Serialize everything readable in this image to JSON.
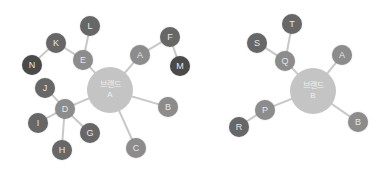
{
  "colors": {
    "edge": "#c8c8c8",
    "hub": "#c4c4c4",
    "level1": "#8c8c8c",
    "level2": "#676767",
    "level3": "#4a4a4a",
    "label": "#e6e6e6"
  },
  "diagrams": [
    {
      "id": "brand-a",
      "hub": {
        "title": "브랜드",
        "label": "A",
        "x": 110,
        "y": 90,
        "r": 23
      },
      "nodes": [
        {
          "id": "A",
          "label": "A",
          "x": 140,
          "y": 55,
          "level": 1
        },
        {
          "id": "B",
          "label": "B",
          "x": 168,
          "y": 107,
          "level": 1
        },
        {
          "id": "C",
          "label": "C",
          "x": 136,
          "y": 148,
          "level": 1
        },
        {
          "id": "D",
          "label": "D",
          "x": 65,
          "y": 109,
          "level": 1
        },
        {
          "id": "E",
          "label": "E",
          "x": 83,
          "y": 60,
          "level": 1
        },
        {
          "id": "F",
          "label": "F",
          "x": 170,
          "y": 37,
          "level": 2
        },
        {
          "id": "G",
          "label": "G",
          "x": 90,
          "y": 133,
          "level": 2
        },
        {
          "id": "H",
          "label": "H",
          "x": 62,
          "y": 150,
          "level": 2
        },
        {
          "id": "I",
          "label": "I",
          "x": 38,
          "y": 123,
          "level": 2
        },
        {
          "id": "J",
          "label": "J",
          "x": 45,
          "y": 88,
          "level": 2
        },
        {
          "id": "K",
          "label": "K",
          "x": 56,
          "y": 43,
          "level": 2
        },
        {
          "id": "L",
          "label": "L",
          "x": 90,
          "y": 26,
          "level": 2
        },
        {
          "id": "M",
          "label": "M",
          "x": 180,
          "y": 66,
          "level": 3
        },
        {
          "id": "N",
          "label": "N",
          "x": 32,
          "y": 65,
          "level": 3
        }
      ],
      "edges": [
        [
          "hub",
          "A"
        ],
        [
          "hub",
          "B"
        ],
        [
          "hub",
          "C"
        ],
        [
          "hub",
          "D"
        ],
        [
          "hub",
          "E"
        ],
        [
          "A",
          "F"
        ],
        [
          "F",
          "M"
        ],
        [
          "E",
          "L"
        ],
        [
          "E",
          "K"
        ],
        [
          "K",
          "N"
        ],
        [
          "D",
          "J"
        ],
        [
          "D",
          "I"
        ],
        [
          "D",
          "H"
        ],
        [
          "D",
          "G"
        ]
      ]
    },
    {
      "id": "brand-b",
      "hub": {
        "title": "브랜드",
        "label": "B",
        "x": 313,
        "y": 91,
        "r": 23
      },
      "nodes": [
        {
          "id": "A",
          "label": "A",
          "x": 342,
          "y": 55,
          "level": 1
        },
        {
          "id": "B",
          "label": "B",
          "x": 358,
          "y": 122,
          "level": 1
        },
        {
          "id": "Q",
          "label": "Q",
          "x": 285,
          "y": 61,
          "level": 1
        },
        {
          "id": "P",
          "label": "P",
          "x": 265,
          "y": 110,
          "level": 1
        },
        {
          "id": "S",
          "label": "S",
          "x": 257,
          "y": 43,
          "level": 2
        },
        {
          "id": "T",
          "label": "T",
          "x": 292,
          "y": 24,
          "level": 2
        },
        {
          "id": "R",
          "label": "R",
          "x": 239,
          "y": 127,
          "level": 2
        }
      ],
      "edges": [
        [
          "hub",
          "A"
        ],
        [
          "hub",
          "B"
        ],
        [
          "hub",
          "Q"
        ],
        [
          "hub",
          "P"
        ],
        [
          "Q",
          "S"
        ],
        [
          "Q",
          "T"
        ],
        [
          "P",
          "R"
        ]
      ]
    }
  ]
}
